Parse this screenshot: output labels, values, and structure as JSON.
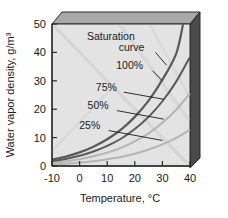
{
  "chart_data": {
    "type": "line",
    "title": "",
    "xlabel": "Temperature, °C",
    "ylabel": "Water vapor density, g/m³",
    "xlim": [
      -10,
      40
    ],
    "ylim": [
      0,
      50
    ],
    "xticks": [
      -10,
      0,
      10,
      20,
      30,
      40
    ],
    "xtick_labels": [
      "-10",
      "0",
      "10",
      "20",
      "30",
      "40"
    ],
    "yticks": [
      0,
      10,
      20,
      30,
      40,
      50
    ],
    "ytick_labels": [
      "0",
      "10",
      "20",
      "30",
      "40",
      "50"
    ],
    "grid": false,
    "legend": "none",
    "annotations": [
      {
        "text": "Saturation",
        "x": 20.0,
        "y": 44.5
      },
      {
        "text": "curve",
        "x": 23.5,
        "y": 40.5
      },
      {
        "text": "100%",
        "x": 23.0,
        "y": 34.0
      },
      {
        "text": "75%",
        "x": 13.5,
        "y": 26.5
      },
      {
        "text": "50%",
        "x": 10.5,
        "y": 20.0
      },
      {
        "text": "25%",
        "x": 7.5,
        "y": 13.0
      }
    ],
    "series": [
      {
        "name": "Saturation curve (100% relative humidity)",
        "relative_humidity_percent": 100,
        "x": [
          -10,
          -5,
          0,
          5,
          10,
          15,
          20,
          25,
          30,
          35,
          37.5
        ],
        "values": [
          2.2,
          3.3,
          4.8,
          6.8,
          9.4,
          12.8,
          17.3,
          23.0,
          30.4,
          39.6,
          50.0
        ]
      },
      {
        "name": "75% relative humidity",
        "relative_humidity_percent": 75,
        "x": [
          -10,
          -5,
          0,
          5,
          10,
          15,
          20,
          25,
          30,
          35,
          40
        ],
        "values": [
          1.7,
          2.5,
          3.6,
          5.1,
          7.1,
          9.6,
          13.0,
          17.3,
          22.8,
          29.7,
          38.4
        ]
      },
      {
        "name": "50% relative humidity",
        "relative_humidity_percent": 50,
        "x": [
          -10,
          -5,
          0,
          5,
          10,
          15,
          20,
          25,
          30,
          35,
          40
        ],
        "values": [
          1.1,
          1.7,
          2.4,
          3.4,
          4.7,
          6.4,
          8.7,
          11.5,
          15.2,
          19.8,
          25.6
        ]
      },
      {
        "name": "25% relative humidity",
        "relative_humidity_percent": 25,
        "x": [
          -10,
          -5,
          0,
          5,
          10,
          15,
          20,
          25,
          30,
          35,
          40
        ],
        "values": [
          0.6,
          0.8,
          1.2,
          1.7,
          2.4,
          3.2,
          4.3,
          5.8,
          7.6,
          9.9,
          12.8
        ]
      }
    ],
    "leader_lines": [
      {
        "label": "Saturation curve",
        "from_x": 27.5,
        "from_y": 40.0,
        "to_x": 31.5,
        "to_y": 35.5
      },
      {
        "label": "100%",
        "from_x": 26.5,
        "from_y": 33.5,
        "to_x": 30.0,
        "to_y": 30.0
      },
      {
        "label": "75%",
        "from_x": 16.0,
        "from_y": 26.0,
        "to_x": 30.5,
        "to_y": 23.5
      },
      {
        "label": "50%",
        "from_x": 13.5,
        "from_y": 19.5,
        "to_x": 30.5,
        "to_y": 16.5
      },
      {
        "label": "25%",
        "from_x": 10.5,
        "from_y": 12.5,
        "to_x": 30.0,
        "to_y": 9.0
      }
    ],
    "colors": {
      "plot_background": "#e3e3e3",
      "box_top_face": "#a8a8a8",
      "box_right_face": "#4a4a4a",
      "curve_dark": "#5a5a5a",
      "curve_light": "#b4b4b4",
      "axis": "#2b2b2b",
      "text": "#1a1a1a"
    }
  }
}
